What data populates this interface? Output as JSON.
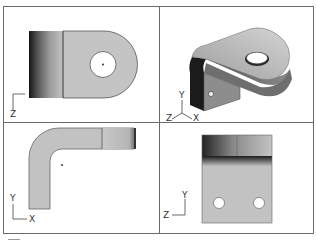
{
  "drawing": {
    "subject": "bent bracket with hole",
    "layout": "2x2 multiview",
    "views": [
      {
        "id": "top",
        "position": "top-left",
        "description": "Top view: rounded tab with center hole, shaded bend on left",
        "axes": {
          "vertical": "",
          "horizontal": "",
          "label": "Z"
        }
      },
      {
        "id": "isometric",
        "position": "top-right",
        "description": "Isometric view of bracket with large hole on tab and small hole on flange",
        "axes": {
          "labels": [
            "Y",
            "Z",
            "X"
          ]
        }
      },
      {
        "id": "front",
        "position": "bottom-left",
        "description": "Front view: L-shaped bent profile",
        "axes": {
          "labels": [
            "Y",
            "X"
          ]
        }
      },
      {
        "id": "side",
        "position": "bottom-right",
        "description": "Side view: flange with two holes, shaded bend on top",
        "axes": {
          "labels": [
            "Y",
            "Z"
          ]
        }
      }
    ],
    "colors": {
      "frame": "#6a6a6a",
      "part_fill": "#c4c4c4",
      "part_dark": "#1e1e1e",
      "background": "#ffffff"
    }
  },
  "labels": {
    "top_z": "Z",
    "iso_y": "Y",
    "iso_z": "Z",
    "iso_x": "X",
    "front_y": "Y",
    "front_x": "X",
    "side_y": "Y",
    "side_z": "Z"
  }
}
